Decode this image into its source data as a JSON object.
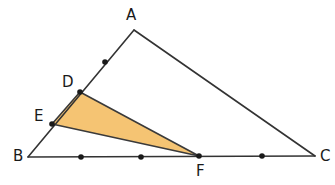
{
  "figure": {
    "width": 335,
    "height": 185,
    "background_color": "#ffffff",
    "stroke_color": "#333333",
    "stroke_width": 1.6,
    "shaded_fill_color": "#f5c473",
    "shaded_stroke_color": "#3a3a3a",
    "point_marker_color": "#1a1a1a",
    "point_marker_radius": 2.8
  },
  "labels": {
    "A": "A",
    "B": "B",
    "C": "C",
    "D": "D",
    "E": "E",
    "F": "F"
  },
  "chart_data": {
    "type": "diagram",
    "vertices": {
      "A": {
        "x": 134,
        "y": 30
      },
      "B": {
        "x": 28,
        "y": 157
      },
      "C": {
        "x": 315,
        "y": 156
      },
      "D": {
        "x": 80,
        "y": 92
      },
      "E": {
        "x": 52,
        "y": 124
      },
      "F": {
        "x": 199,
        "y": 156
      }
    },
    "outer_triangle": [
      "A",
      "B",
      "C"
    ],
    "shaded_triangle": [
      "D",
      "E",
      "F"
    ],
    "marked_points": [
      {
        "name": "ab-tick",
        "x": 105,
        "y": 62,
        "on_segment": "AB"
      },
      {
        "name": "D",
        "x": 80,
        "y": 92,
        "on_segment": "AB"
      },
      {
        "name": "E",
        "x": 52,
        "y": 124,
        "on_segment": "AB"
      },
      {
        "name": "bc-tick-1",
        "x": 81,
        "y": 157,
        "on_segment": "BC"
      },
      {
        "name": "bc-tick-2",
        "x": 141,
        "y": 157,
        "on_segment": "BC"
      },
      {
        "name": "F",
        "x": 199,
        "y": 156,
        "on_segment": "BC"
      },
      {
        "name": "bc-tick-3",
        "x": 262,
        "y": 156,
        "on_segment": "BC"
      }
    ],
    "label_positions": {
      "A": {
        "x": 126,
        "y": 8
      },
      "B": {
        "x": 13,
        "y": 149
      },
      "C": {
        "x": 320,
        "y": 149
      },
      "D": {
        "x": 62,
        "y": 75
      },
      "E": {
        "x": 34,
        "y": 109
      },
      "F": {
        "x": 196,
        "y": 164
      }
    }
  }
}
